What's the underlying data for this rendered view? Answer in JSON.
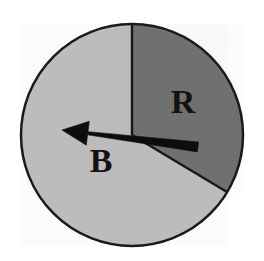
{
  "figure": {
    "name": "spinner-wheel",
    "type": "probability-spinner",
    "background_color": "#ffffff",
    "width": 264,
    "height": 261
  },
  "circle": {
    "center_x": 132,
    "center_y": 135,
    "radius": 111,
    "outline_color": "#1a1a1a",
    "outline_width": 2.5
  },
  "sectors": [
    {
      "label": "R",
      "name": "sector-r",
      "color": "#707070",
      "start_angle_deg": -90,
      "end_angle_deg": 31,
      "sweep_deg": 121,
      "label_x": 183,
      "label_y": 105
    },
    {
      "label": "B",
      "name": "sector-b",
      "color": "#bcbcbc",
      "start_angle_deg": 31,
      "end_angle_deg": 270,
      "sweep_deg": 239,
      "label_x": 101,
      "label_y": 164
    }
  ],
  "pointer": {
    "name": "spinner-arrow",
    "color": "#0d0d0d",
    "pivot_x": 133,
    "pivot_y": 137,
    "tail_x": 198,
    "tail_y": 147,
    "tip_x": 62,
    "tip_y": 130,
    "tail_half_width": 5,
    "head_length": 26,
    "head_half_width": 12,
    "direction": "left"
  },
  "divider_lines": [
    {
      "name": "divider-vertical-top",
      "from_x": 132,
      "from_y": 135,
      "to_x": 132,
      "to_y": 24,
      "color": "#1a1a1a",
      "width": 2.5
    },
    {
      "name": "divider-lower-right",
      "from_x": 132,
      "from_y": 135,
      "to_x": 227,
      "to_y": 192,
      "color": "#1a1a1a",
      "width": 2.5
    }
  ]
}
